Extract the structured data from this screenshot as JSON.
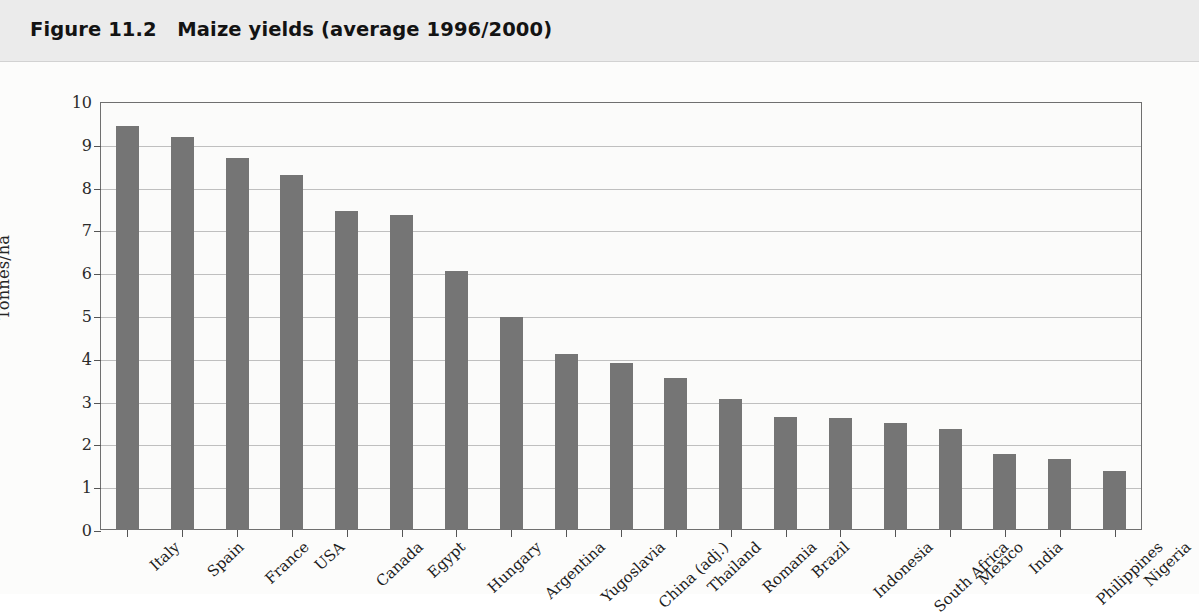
{
  "header": {
    "figure_number": "Figure 11.2",
    "figure_title": "Maize yields (average 1996/2000)",
    "full_title": "Figure 11.2   Maize yields (average 1996/2000)"
  },
  "colors": {
    "bar_fill": "#757575",
    "frame": "#6f6f6f",
    "gridline": "#bfbfbf",
    "header_band": "#ebebeb",
    "plot_background": "#fbfbfa",
    "text": "#1d1d1d"
  },
  "chart_data": {
    "type": "bar",
    "title": "Maize yields (average 1996/2000)",
    "xlabel": "",
    "ylabel": "Tonnes/ha",
    "ylim": [
      0,
      10
    ],
    "yticks": [
      0,
      1,
      2,
      3,
      4,
      5,
      6,
      7,
      8,
      9,
      10
    ],
    "ytick_labels": [
      "0",
      "1",
      "2",
      "3",
      "4",
      "5",
      "6",
      "7",
      "8",
      "9",
      "10"
    ],
    "grid": true,
    "legend": null,
    "categories": [
      "Italy",
      "Spain",
      "France",
      "USA",
      "Canada",
      "Egypt",
      "Hungary",
      "Argentina",
      "Yugoslavia",
      "China (adj.)",
      "Thailand",
      "Romania",
      "Brazil",
      "Indonesia",
      "South Africa",
      "Mexico",
      "India",
      "Philippines",
      "Nigeria"
    ],
    "values": [
      9.45,
      9.18,
      8.7,
      8.3,
      7.45,
      7.37,
      6.05,
      4.98,
      4.12,
      3.9,
      3.55,
      3.05,
      2.65,
      2.62,
      2.5,
      2.35,
      1.77,
      1.67,
      1.37
    ]
  }
}
